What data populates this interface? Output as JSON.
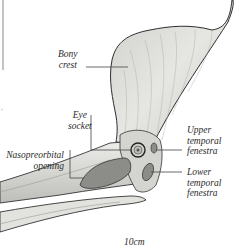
{
  "diagram": {
    "labels": {
      "bony_crest": [
        "Bony",
        "crest"
      ],
      "eye_socket": [
        "Eye",
        "socket"
      ],
      "nasopreorbital_opening": [
        "Nasopreorbital",
        "opening"
      ],
      "upper_temporal_fenestra": [
        "Upper",
        "temporal",
        "fenestra"
      ],
      "lower_temporal_fenestra": [
        "Lower",
        "temporal",
        "fenestra"
      ]
    },
    "scale_bar": {
      "label": "10cm"
    },
    "colors": {
      "background": "#ffffff",
      "bone_fill": "#d9d9d6",
      "bone_outline": "#3a3a3a",
      "opening_fill": "#8c8c88",
      "leader_line": "#444444",
      "text": "#2a2a2a"
    }
  }
}
